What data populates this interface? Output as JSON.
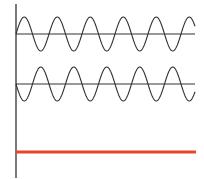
{
  "diagram": {
    "type": "waveform-comparison",
    "axis": {
      "x": 16,
      "y_top": 4,
      "y_bottom": 178,
      "color": "#333333"
    },
    "waves": [
      {
        "name": "wave-1",
        "baseline_y": 34,
        "amplitude": 17,
        "period": 33,
        "phase": "up-first",
        "x_start": 16,
        "x_end": 195,
        "color": "#333333"
      },
      {
        "name": "wave-2",
        "baseline_y": 84,
        "amplitude": 17,
        "period": 33,
        "phase": "down-first",
        "x_start": 16,
        "x_end": 195,
        "color": "#333333"
      }
    ],
    "flat_line": {
      "y": 152,
      "x_start": 16,
      "x_end": 196,
      "color": "#e8442a",
      "width": 3
    }
  }
}
